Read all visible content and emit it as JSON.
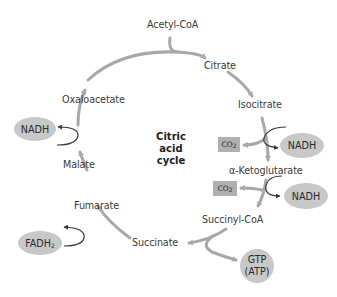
{
  "diagram": {
    "title": "Citric acid cycle",
    "center_label": [
      "Citric",
      "acid",
      "cycle"
    ],
    "input": "Acetyl-CoA",
    "intermediates": [
      "Citrate",
      "Isocitrate",
      "α-Ketoglutarate",
      "Succinyl-CoA",
      "Succinate",
      "Fumarate",
      "Malate",
      "Oxaloacetate"
    ],
    "products": {
      "nadh_1": "NADH",
      "co2_1": "CO",
      "co2_1_sub": "2",
      "nadh_2": "NADH",
      "co2_2": "CO",
      "co2_2_sub": "2",
      "gtp_line1": "GTP",
      "gtp_line2": "(ATP)",
      "fadh2": "FADH",
      "fadh2_sub": "2",
      "nadh_3": "NADH"
    },
    "colors": {
      "arrow": "#a8a8a8",
      "side_arrow": "#3a3a3a",
      "oval_fill": "#c8c8c8",
      "box_fill": "#b0b0b0",
      "text": "#3a3a3a"
    }
  }
}
